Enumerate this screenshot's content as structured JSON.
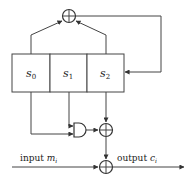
{
  "diagram": {
    "type": "stream-cipher-shift-register",
    "registers": [
      {
        "name": "s",
        "sub": "0"
      },
      {
        "name": "s",
        "sub": "1"
      },
      {
        "name": "s",
        "sub": "2"
      }
    ],
    "gates": [
      {
        "type": "xor",
        "role": "feedback",
        "inputs": [
          "s0",
          "s2"
        ]
      },
      {
        "type": "and",
        "role": "nonlinear-filter",
        "inputs": [
          "s0",
          "s1"
        ]
      },
      {
        "type": "xor",
        "role": "keystream",
        "inputs": [
          "and-output",
          "s2"
        ]
      },
      {
        "type": "xor",
        "role": "encryption",
        "inputs": [
          "input",
          "keystream"
        ]
      }
    ],
    "input_label": {
      "word": "input",
      "var": "m",
      "sub": "i"
    },
    "output_label": {
      "word": "output",
      "var": "c",
      "sub": "i"
    }
  }
}
